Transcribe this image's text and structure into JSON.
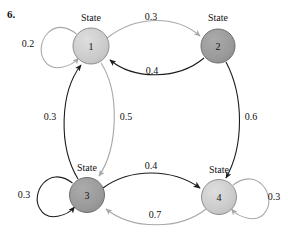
{
  "problem": {
    "number": "6."
  },
  "diagram": {
    "type": "state-transition-diagram",
    "title": "",
    "nodes": [
      {
        "id": "state1",
        "word": "State",
        "number": "1",
        "cx": 91,
        "cy": 46,
        "r": 18,
        "fill": "#cccccc",
        "stroke": "#8a8a8a",
        "label_x": 91,
        "label_y": 17
      },
      {
        "id": "state2",
        "word": "State",
        "number": "2",
        "cx": 218,
        "cy": 46,
        "r": 17,
        "fill": "#9b9b9b",
        "stroke": "#6f6f6f",
        "label_x": 218,
        "label_y": 17
      },
      {
        "id": "state3",
        "word": "State",
        "number": "3",
        "cx": 87,
        "cy": 195,
        "r": 17,
        "fill": "#9b9b9b",
        "stroke": "#6f6f6f",
        "label_x": 87,
        "label_y": 167
      },
      {
        "id": "state4",
        "word": "State",
        "number": "4",
        "cx": 219,
        "cy": 197,
        "r": 17,
        "fill": "#cccccc",
        "stroke": "#8a8a8a",
        "label_x": 219,
        "label_y": 169
      }
    ],
    "edges": [
      {
        "id": "e-1-1",
        "from": "state1",
        "to": "state1",
        "weight": "0.2",
        "label_x": 28,
        "label_y": 44,
        "tone": "light"
      },
      {
        "id": "e-1-2",
        "from": "state1",
        "to": "state2",
        "weight": "0.3",
        "label_x": 151,
        "label_y": 17,
        "tone": "light"
      },
      {
        "id": "e-2-1",
        "from": "state2",
        "to": "state1",
        "weight": "0.4",
        "label_x": 152,
        "label_y": 71,
        "tone": "dark"
      },
      {
        "id": "e-2-4",
        "from": "state2",
        "to": "state4",
        "weight": "0.6",
        "label_x": 251,
        "label_y": 117,
        "tone": "dark"
      },
      {
        "id": "e-3-1",
        "from": "state3",
        "to": "state1",
        "weight": "0.3",
        "label_x": 50,
        "label_y": 117,
        "tone": "dark"
      },
      {
        "id": "e-1-3",
        "from": "state1",
        "to": "state3",
        "weight": "0.5",
        "label_x": 126,
        "label_y": 117,
        "tone": "light"
      },
      {
        "id": "e-3-3",
        "from": "state3",
        "to": "state3",
        "weight": "0.3",
        "label_x": 24,
        "label_y": 195,
        "tone": "dark"
      },
      {
        "id": "e-3-4",
        "from": "state3",
        "to": "state4",
        "weight": "0.4",
        "label_x": 151,
        "label_y": 166,
        "tone": "dark"
      },
      {
        "id": "e-4-3",
        "from": "state4",
        "to": "state3",
        "weight": "0.7",
        "label_x": 155,
        "label_y": 215,
        "tone": "light"
      },
      {
        "id": "e-4-4",
        "from": "state4",
        "to": "state4",
        "weight": "0.3",
        "label_x": 274,
        "label_y": 197,
        "tone": "light"
      }
    ],
    "colors": {
      "light_edge": "#a8a8a8",
      "dark_edge": "#1c1c1c",
      "node_light": "#cccccc",
      "node_dark": "#9b9b9b",
      "text": "#111111",
      "background": "#ffffff"
    }
  }
}
